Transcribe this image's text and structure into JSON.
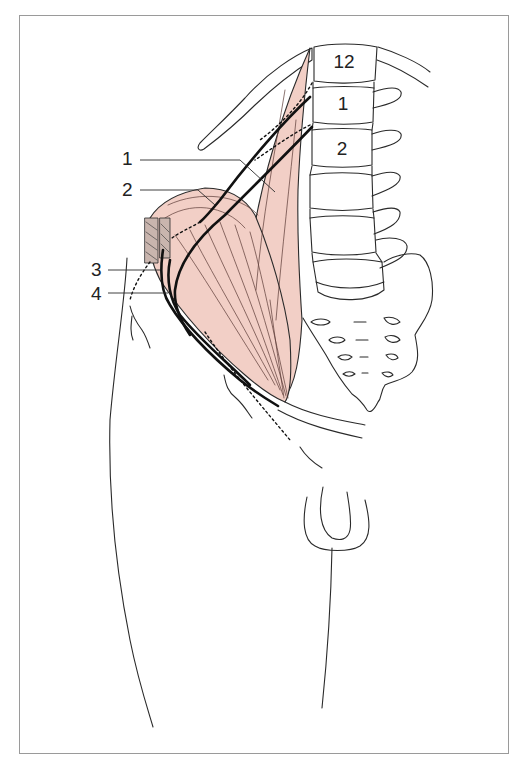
{
  "figure": {
    "colors": {
      "muscle_fill": "#F2CFC6",
      "outline": "#2a2a2a",
      "frame_border": "#9a9a9a",
      "background": "#ffffff"
    },
    "callouts": [
      {
        "id": "1",
        "label": "1"
      },
      {
        "id": "2",
        "label": "2"
      },
      {
        "id": "3",
        "label": "3"
      },
      {
        "id": "4",
        "label": "4"
      }
    ],
    "vertebra_labels": [
      {
        "label": "12"
      },
      {
        "label": "1"
      },
      {
        "label": "2"
      }
    ]
  }
}
